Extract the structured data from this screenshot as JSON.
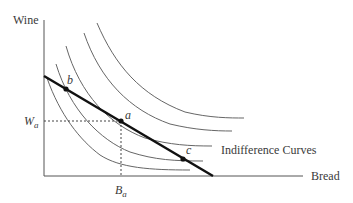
{
  "diagram": {
    "type": "indifference-curve-budget-line",
    "y_axis_label": "Wine",
    "x_axis_label": "Bread",
    "curves_label": "Indifference Curves",
    "points": [
      {
        "name": "b",
        "x": 66,
        "y": 89
      },
      {
        "name": "a",
        "x": 121,
        "y": 121
      },
      {
        "name": "c",
        "x": 183,
        "y": 159
      }
    ],
    "wa_label": "W",
    "wa_sub": "a",
    "ba_label": "B",
    "ba_sub": "a",
    "colors": {
      "axis": "#555555",
      "curve": "#666666",
      "budget_line": "#111111",
      "text": "#3a3a3a"
    }
  }
}
